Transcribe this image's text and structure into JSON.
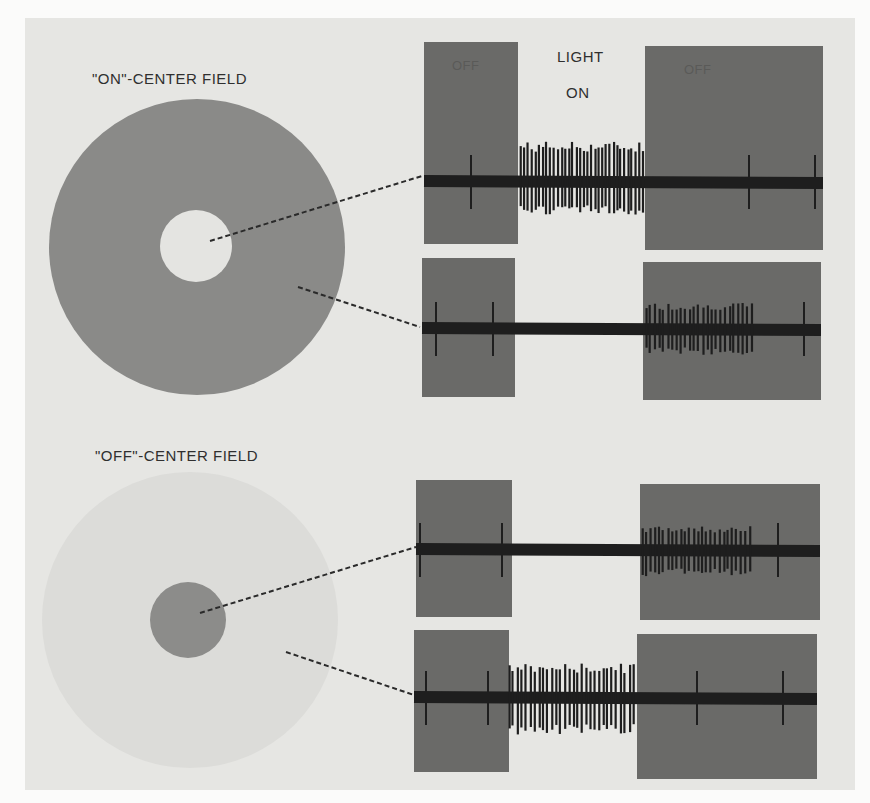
{
  "figure": {
    "header": {
      "light_label_line1": "LIGHT",
      "light_label_line2": "ON"
    },
    "on_center": {
      "title": "\"ON\"-CENTER FIELD",
      "surround_color": "#8a8a88",
      "center_color": "#e4e4e1"
    },
    "off_center": {
      "title": "\"OFF\"-CENTER FIELD",
      "surround_color": "#dcdcd9",
      "center_color": "#8c8c8a"
    },
    "off_box_label": "OFF",
    "colors": {
      "paper": "#e6e6e3",
      "off_box": "#6a6a68",
      "trace": "#1e1e1e"
    },
    "traces": [
      {
        "id": "on-center-center-stimulus",
        "description": "Light on center of ON-center field: burst during light ON",
        "box_left": [
          424,
          42,
          94,
          202
        ],
        "box_right": [
          645,
          46,
          178,
          204
        ],
        "baseline_y": 181,
        "x_start": 424,
        "x_end": 823,
        "burst": {
          "x0": 520,
          "x1": 646,
          "count": 34,
          "amp_up": 38,
          "amp_down": 32
        },
        "sparse_spikes": [
          471,
          749,
          815
        ]
      },
      {
        "id": "on-center-surround-stimulus",
        "description": "Light on surround of ON-center field: suppressed during ON, burst after OFF",
        "box_left": [
          422,
          258,
          93,
          139
        ],
        "box_right": [
          643,
          262,
          178,
          138
        ],
        "baseline_y": 328,
        "x_start": 422,
        "x_end": 821,
        "burst": {
          "x0": 645,
          "x1": 755,
          "count": 25,
          "amp_up": 24,
          "amp_down": 26
        },
        "sparse_spikes": [
          436,
          493,
          804
        ]
      },
      {
        "id": "off-center-center-stimulus",
        "description": "Light on center of OFF-center field: suppressed during ON, burst after OFF",
        "box_left": [
          416,
          480,
          96,
          137
        ],
        "box_right": [
          640,
          484,
          180,
          136
        ],
        "baseline_y": 549,
        "x_start": 416,
        "x_end": 820,
        "burst": {
          "x0": 641,
          "x1": 753,
          "count": 26,
          "amp_up": 22,
          "amp_down": 26
        },
        "sparse_spikes": [
          420,
          502,
          778
        ]
      },
      {
        "id": "off-center-surround-stimulus",
        "description": "Light on surround of OFF-center field: burst during light ON",
        "box_left": [
          414,
          630,
          95,
          142
        ],
        "box_right": [
          637,
          634,
          180,
          145
        ],
        "baseline_y": 697,
        "x_start": 414,
        "x_end": 817,
        "burst": {
          "x0": 508,
          "x1": 637,
          "count": 30,
          "amp_up": 32,
          "amp_down": 36
        },
        "sparse_spikes": [
          426,
          488,
          697,
          783
        ]
      }
    ],
    "pointers": [
      {
        "from": [
          210,
          241
        ],
        "to": [
          422,
          176
        ]
      },
      {
        "from": [
          298,
          287
        ],
        "to": [
          420,
          327
        ]
      },
      {
        "from": [
          200,
          613
        ],
        "to": [
          416,
          547
        ]
      },
      {
        "from": [
          286,
          652
        ],
        "to": [
          414,
          695
        ]
      }
    ]
  }
}
